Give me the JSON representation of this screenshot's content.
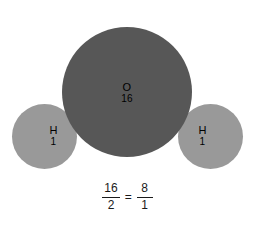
{
  "diagram": {
    "background_color": "#ffffff",
    "atoms": [
      {
        "id": "oxygen",
        "symbol": "O",
        "mass": "16",
        "color": "#575757",
        "size": "large",
        "position": "center"
      },
      {
        "id": "hydrogen-left",
        "symbol": "H",
        "mass": "1",
        "color": "#999999",
        "size": "small",
        "position": "left"
      },
      {
        "id": "hydrogen-right",
        "symbol": "H",
        "mass": "1",
        "color": "#999999",
        "size": "small",
        "position": "right"
      }
    ]
  },
  "equation": {
    "left_fraction": {
      "numerator": "16",
      "denominator": "2"
    },
    "operator": "=",
    "right_fraction": {
      "numerator": "8",
      "denominator": "1"
    }
  }
}
